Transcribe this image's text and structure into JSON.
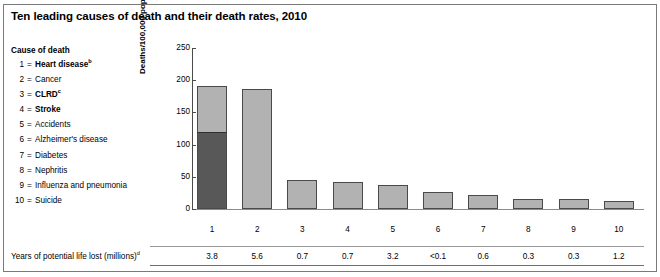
{
  "title": "Ten leading causes of death and their death rates, 2010",
  "legend": {
    "heading": "Cause of death",
    "items": [
      {
        "num": "1",
        "eq": "=",
        "label": "Heart disease",
        "sup": "b",
        "bold": true
      },
      {
        "num": "2",
        "eq": "=",
        "label": "Cancer",
        "sup": "",
        "bold": false
      },
      {
        "num": "3",
        "eq": "=",
        "label": "CLRD",
        "sup": "c",
        "bold": true
      },
      {
        "num": "4",
        "eq": "=",
        "label": "Stroke",
        "sup": "",
        "bold": true
      },
      {
        "num": "5",
        "eq": "=",
        "label": "Accidents",
        "sup": "",
        "bold": false
      },
      {
        "num": "6",
        "eq": "=",
        "label": "Alzheimer's disease",
        "sup": "",
        "bold": false
      },
      {
        "num": "7",
        "eq": "=",
        "label": "Diabetes",
        "sup": "",
        "bold": false
      },
      {
        "num": "8",
        "eq": "=",
        "label": "Nephritis",
        "sup": "",
        "bold": false
      },
      {
        "num": "9",
        "eq": "=",
        "label": "Influenza and pneumonia",
        "sup": "",
        "bold": false
      },
      {
        "num": "10",
        "eq": "=",
        "label": "Suicide",
        "sup": "",
        "bold": false
      }
    ]
  },
  "footer": {
    "label": "Years of potential life lost (millions)",
    "label_sup": "d"
  },
  "colors": {
    "bar_light": "#b2b2b2",
    "bar_dark": "#585858",
    "bar_outline": "#4a4a4a",
    "axis": "#4b4b4b",
    "frame": "#7a7a7a"
  },
  "chart_data": {
    "type": "bar",
    "title": "Ten leading causes of death and their death rates, 2010",
    "xlabel": "",
    "ylabel": "Deaths/100,000 population",
    "ylabel_sup": "a",
    "ylim": [
      0,
      250
    ],
    "yticks": [
      0,
      50,
      100,
      150,
      200,
      250
    ],
    "ytick_labels": [
      "0",
      "50",
      "100",
      "150",
      "200",
      "250"
    ],
    "grid": false,
    "legend_position": "left-outside",
    "categories": [
      "1",
      "2",
      "3",
      "4",
      "5",
      "6",
      "7",
      "8",
      "9",
      "10"
    ],
    "category_names": [
      "Heart disease",
      "Cancer",
      "CLRD",
      "Stroke",
      "Accidents",
      "Alzheimer's disease",
      "Diabetes",
      "Nephritis",
      "Influenza and pneumonia",
      "Suicide"
    ],
    "values": [
      193,
      186,
      45,
      42,
      38,
      27,
      22,
      16,
      16,
      12
    ],
    "stacked_first_bar": {
      "category": "1",
      "dark_segment": 120,
      "light_segment": 73,
      "total": 193
    },
    "secondary_table": {
      "row_label": "Years of potential life lost (millions)",
      "values": [
        "3.8",
        "5.6",
        "0.7",
        "0.7",
        "3.2",
        "<0.1",
        "0.6",
        "0.3",
        "0.3",
        "1.2"
      ]
    }
  }
}
